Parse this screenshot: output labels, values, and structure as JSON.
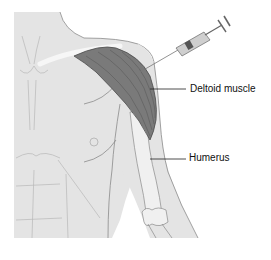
{
  "diagram": {
    "labels": {
      "deltoid": "Deltoid muscle",
      "humerus": "Humerus"
    },
    "colors": {
      "skin": "#e4e4e4",
      "outline": "#8a8a8a",
      "muscle": "#7a7a7a",
      "muscle_fiber": "#5a5a5a",
      "bone": "#f0f0f0",
      "syringe_barrel": "#cfcfcf",
      "syringe_plunger": "#555555",
      "leader_line": "#222222"
    }
  }
}
